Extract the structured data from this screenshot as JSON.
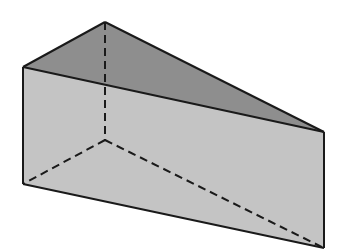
{
  "diagram": {
    "type": "triangular-prism",
    "colors": {
      "background": "#ffffff",
      "top_face": "#8e8e8e",
      "front_face": "#c4c4c4",
      "edge": "#1a1a1a"
    },
    "vertices": {
      "apex_top": [
        105,
        22
      ],
      "front_top_left": [
        23,
        67
      ],
      "front_top_right": [
        324,
        132
      ],
      "front_bottom_left": [
        23,
        184
      ],
      "front_bottom_right": [
        324,
        248
      ],
      "hidden_bottom": [
        105,
        140
      ]
    },
    "faces": [
      "top-triangle",
      "front-rectangle"
    ],
    "visible_edges": 7,
    "hidden_edges": 3
  }
}
